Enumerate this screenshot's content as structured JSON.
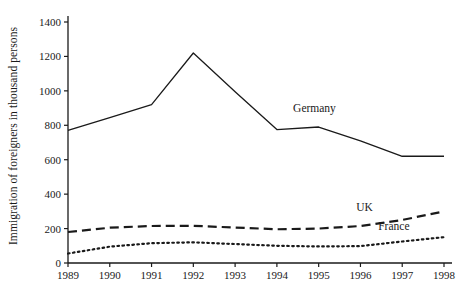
{
  "chart_data": {
    "type": "line",
    "title": "",
    "subtitle": "",
    "xlabel": "",
    "ylabel": "Immigration of foreigners in thousand persons",
    "x": [
      1989,
      1990,
      1991,
      1992,
      1993,
      1994,
      1995,
      1996,
      1997,
      1998
    ],
    "xtick_labels": [
      "1989",
      "1990",
      "1991",
      "1992",
      "1993",
      "1994",
      "1995",
      "1996",
      "1997",
      "1998"
    ],
    "ytick_labels": [
      "0",
      "200",
      "400",
      "600",
      "800",
      "1000",
      "1200",
      "1400"
    ],
    "yticks": [
      0,
      200,
      400,
      600,
      800,
      1000,
      1200,
      1400
    ],
    "ylim": [
      0,
      1400
    ],
    "xlim": [
      1989,
      1998
    ],
    "grid": false,
    "legend_position": "inline-annotation",
    "series": [
      {
        "name": "Germany",
        "style": "solid",
        "color": "#1a1a1a",
        "label_x": 1994.9,
        "label_y": 880,
        "values": [
          770,
          845,
          920,
          1220,
          995,
          775,
          790,
          710,
          620,
          620
        ]
      },
      {
        "name": "UK",
        "style": "dashed",
        "color": "#1a1a1a",
        "label_x": 1996.1,
        "label_y": 300,
        "values": [
          180,
          205,
          215,
          216,
          206,
          196,
          200,
          215,
          250,
          300
        ]
      },
      {
        "name": "France",
        "style": "dotted",
        "color": "#1a1a1a",
        "label_x": 1996.8,
        "label_y": 190,
        "values": [
          55,
          95,
          115,
          120,
          110,
          100,
          96,
          98,
          125,
          150
        ]
      }
    ]
  },
  "axis": {
    "line_color": "#1a1a1a",
    "tick_color": "#1a1a1a"
  }
}
